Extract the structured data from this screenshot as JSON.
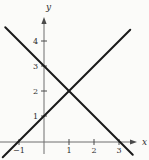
{
  "figure": {
    "background": "#fbfbf9",
    "axis_color": "#6e6e6e",
    "tick_color": "#4a4a4a",
    "line_color": "#1a1a1a",
    "label_color": "#2e2e2e"
  },
  "chart_data": {
    "type": "line",
    "title": "",
    "xlabel": "x",
    "ylabel": "y",
    "xlim": [
      -1.8,
      4.2
    ],
    "ylim": [
      -0.9,
      5.1
    ],
    "x_ticks": [
      -1,
      1,
      2,
      3
    ],
    "y_ticks": [
      1,
      2,
      3,
      4
    ],
    "grid": false,
    "legend": false,
    "series": [
      {
        "name": "line-rising",
        "slope": 1,
        "y_intercept": 1,
        "x_intercept": -1,
        "points": [
          [
            -1.65,
            -0.65
          ],
          [
            3.45,
            4.45
          ]
        ]
      },
      {
        "name": "line-falling",
        "slope": -1,
        "y_intercept": 3,
        "x_intercept": 3,
        "points": [
          [
            -1.55,
            4.55
          ],
          [
            3.55,
            -0.55
          ]
        ]
      }
    ],
    "intersection_point": [
      1,
      2
    ]
  }
}
